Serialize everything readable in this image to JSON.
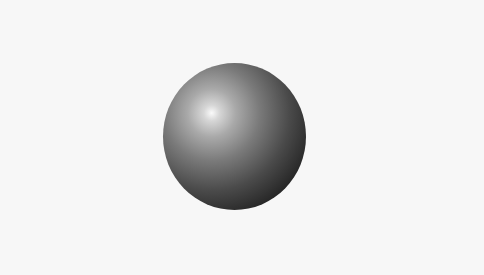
{
  "scene": {
    "description": "shaded 3D sphere on light background",
    "background_color": "#f7f7f7",
    "sphere": {
      "center": [
        234,
        136
      ],
      "radius": 72,
      "highlight_position": [
        212,
        113
      ],
      "highlight_color": "#fafafa",
      "shadow_color": "#111111"
    }
  }
}
